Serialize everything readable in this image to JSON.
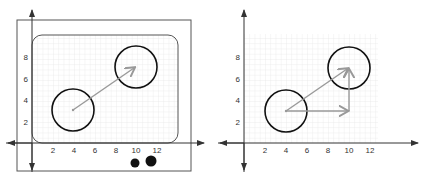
{
  "diagram": {
    "panels": [
      {
        "id": "left",
        "description": "Grid inside rounded rectangle inside frame, vector from circle at (4,3) to circle at (10,7)",
        "x_ticks": [
          "2",
          "4",
          "6",
          "8",
          "10",
          "12"
        ],
        "y_ticks": [
          "2",
          "4",
          "6",
          "8"
        ],
        "circles": [
          {
            "cx": 4,
            "cy": 3,
            "r": 2
          },
          {
            "cx": 10,
            "cy": 7,
            "r": 2
          }
        ],
        "arrows": [
          {
            "from": [
              4,
              3
            ],
            "to": [
              10,
              7
            ]
          }
        ],
        "dots": [
          {
            "x": 10.8,
            "y": -3.0,
            "r": 0.4
          },
          {
            "x": 12.3,
            "y": -2.8,
            "r": 0.55
          }
        ]
      },
      {
        "id": "right",
        "description": "Grid with diagonal vector and horizontal+vertical component vectors",
        "x_ticks": [
          "2",
          "4",
          "6",
          "8",
          "10",
          "12"
        ],
        "y_ticks": [
          "2",
          "4",
          "6",
          "8"
        ],
        "circles": [
          {
            "cx": 4,
            "cy": 3,
            "r": 2
          },
          {
            "cx": 10,
            "cy": 7,
            "r": 2
          }
        ],
        "arrows": [
          {
            "from": [
              4,
              3
            ],
            "to": [
              10,
              7
            ]
          },
          {
            "from": [
              4,
              3
            ],
            "to": [
              10,
              3
            ]
          },
          {
            "from": [
              10,
              3
            ],
            "to": [
              10,
              7
            ]
          }
        ]
      }
    ],
    "colors": {
      "axis": "#333333",
      "grid": "#dcdcdc",
      "circle": "#111111",
      "arrow": "#999999",
      "frame": "#555555"
    }
  }
}
